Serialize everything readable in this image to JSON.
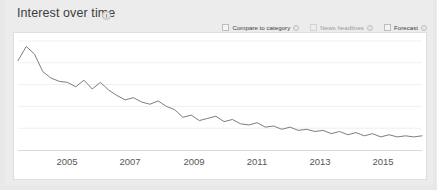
{
  "panel": {
    "title": "Interest over time",
    "title_info_icon": "info-icon"
  },
  "controls": [
    {
      "label": "Compare to category",
      "checked": false,
      "enabled": true,
      "info_icon": "info-icon"
    },
    {
      "label": "News headlines",
      "checked": false,
      "enabled": false,
      "info_icon": "info-icon"
    },
    {
      "label": "Forecast",
      "checked": false,
      "enabled": true,
      "info_icon": "info-icon"
    }
  ],
  "colors": {
    "line": "#6d6d78",
    "grid": "#f0f0f0",
    "axis": "#d8d8d8",
    "panel_bg": "#ececec",
    "card_bg": "#ffffff"
  },
  "chart_data": {
    "type": "line",
    "title": "Interest over time",
    "xlabel": "",
    "ylabel": "",
    "ylim": [
      0,
      100
    ],
    "grid": true,
    "legend_position": "none",
    "x_tick_labels": [
      "2005",
      "2007",
      "2009",
      "2011",
      "2013",
      "2015"
    ],
    "x_tick_positions": [
      53,
      116,
      180,
      243,
      306,
      369
    ],
    "y_gridlines": [
      0,
      20,
      40,
      60,
      80,
      100
    ],
    "series": [
      {
        "name": "Search interest",
        "x": [
          "2004-01",
          "2004-04",
          "2004-07",
          "2004-10",
          "2005-01",
          "2005-04",
          "2005-07",
          "2005-10",
          "2006-01",
          "2006-04",
          "2006-07",
          "2006-10",
          "2007-01",
          "2007-04",
          "2007-07",
          "2007-10",
          "2008-01",
          "2008-04",
          "2008-07",
          "2008-10",
          "2009-01",
          "2009-04",
          "2009-07",
          "2009-10",
          "2010-01",
          "2010-04",
          "2010-07",
          "2010-10",
          "2011-01",
          "2011-04",
          "2011-07",
          "2011-10",
          "2012-01",
          "2012-04",
          "2012-07",
          "2012-10",
          "2013-01",
          "2013-04",
          "2013-07",
          "2013-10",
          "2014-01",
          "2014-04",
          "2014-07",
          "2014-10",
          "2015-01",
          "2015-04",
          "2015-07",
          "2015-10",
          "2016-01",
          "2016-04"
        ],
        "values": [
          82,
          95,
          88,
          72,
          66,
          63,
          62,
          58,
          64,
          56,
          62,
          55,
          50,
          46,
          48,
          44,
          42,
          45,
          40,
          37,
          30,
          32,
          27,
          29,
          31,
          26,
          28,
          24,
          23,
          25,
          21,
          22,
          19,
          21,
          18,
          19,
          17,
          18,
          15,
          17,
          14,
          16,
          13,
          15,
          12,
          14,
          12,
          13,
          12,
          13
        ]
      }
    ]
  }
}
